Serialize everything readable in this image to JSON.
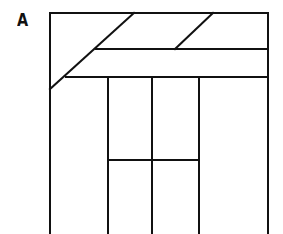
{
  "figure": {
    "label": "A",
    "stroke_color": "#111111",
    "background": "#ffffff"
  },
  "diagram": {
    "outer_frame": {
      "left": 50,
      "top": 13,
      "right": 268,
      "bottom": 234
    },
    "horizontal_lines": [
      {
        "y": 49,
        "x1": 96,
        "x2": 268
      },
      {
        "y": 77,
        "x1": 66,
        "x2": 268
      },
      {
        "y": 160,
        "x1": 108,
        "x2": 199
      }
    ],
    "diagonals": [
      {
        "x1": 50,
        "y1": 89,
        "x2": 134,
        "y2": 13
      },
      {
        "x1": 175,
        "y1": 49,
        "x2": 213,
        "y2": 13
      }
    ],
    "inner_rect": {
      "left": 108,
      "right": 199,
      "top": 77,
      "bottom": 234,
      "middle_x": 152
    }
  }
}
